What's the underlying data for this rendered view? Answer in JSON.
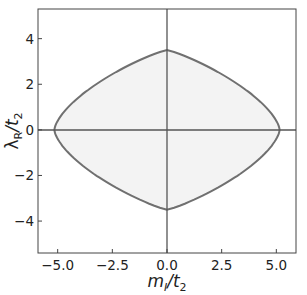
{
  "chart_data": {
    "type": "area",
    "title": "",
    "xlabel": "m_I/t_2",
    "ylabel": "λ_R/t_2",
    "xlim": [
      -5.9,
      5.9
    ],
    "ylim": [
      -5.4,
      5.3
    ],
    "x_ticks": [
      "−5.0",
      "−2.5",
      "0.0",
      "2.5",
      "5.0"
    ],
    "y_ticks": [
      "−4",
      "−2",
      "0",
      "2",
      "4"
    ],
    "grid": false,
    "legend": null,
    "reference_lines": {
      "x": 0,
      "y": 0
    },
    "series": [
      {
        "name": "phase boundary (closed region, shaded)",
        "x": [
          0,
          -1.7,
          -3.5,
          -4.6,
          -5.15,
          -4.6,
          -3.5,
          -1.7,
          0,
          1.7,
          3.5,
          4.6,
          5.15,
          4.6,
          3.5,
          1.7,
          0
        ],
        "y": [
          3.5,
          3.0,
          1.9,
          0.95,
          0,
          -0.95,
          -1.9,
          -3.0,
          -3.5,
          -3.0,
          -1.9,
          -0.95,
          0,
          0.95,
          1.9,
          3.0,
          3.5
        ]
      }
    ],
    "colors": {
      "boundary": "#6e6e6e",
      "fill": "#f3f3f3",
      "axis_lines": "#555555"
    }
  },
  "axes": {
    "xlabel_main": "m",
    "xlabel_sub": "I",
    "xlabel_den": "/t",
    "xlabel_den_sub": "2",
    "ylabel_main": "λ",
    "ylabel_sub": "R",
    "ylabel_den": "/t",
    "ylabel_den_sub": "2"
  }
}
